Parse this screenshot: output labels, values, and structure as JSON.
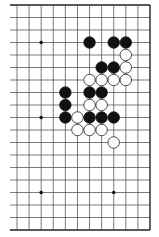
{
  "diagram": {
    "type": "go-board-partial",
    "board_size": 19,
    "visible_columns": [
      7,
      18
    ],
    "visible_rows": [
      0,
      18
    ],
    "edges": {
      "top": true,
      "right": true,
      "bottom": true,
      "left": false
    },
    "colors": {
      "background": "#ffffff",
      "line": "#444444",
      "edge": "#222222",
      "black": "#111111",
      "white": "#ffffff"
    },
    "hoshi": [
      {
        "row": 3,
        "col": 9
      },
      {
        "row": 9,
        "col": 9
      },
      {
        "row": 15,
        "col": 9
      },
      {
        "row": 15,
        "col": 15
      }
    ],
    "stones": [
      {
        "row": 3,
        "col": 13,
        "color": "black"
      },
      {
        "row": 3,
        "col": 15,
        "color": "black"
      },
      {
        "row": 3,
        "col": 16,
        "color": "black"
      },
      {
        "row": 4,
        "col": 16,
        "color": "white"
      },
      {
        "row": 5,
        "col": 14,
        "color": "black"
      },
      {
        "row": 5,
        "col": 15,
        "color": "black"
      },
      {
        "row": 5,
        "col": 16,
        "color": "white"
      },
      {
        "row": 6,
        "col": 13,
        "color": "white"
      },
      {
        "row": 6,
        "col": 14,
        "color": "white"
      },
      {
        "row": 6,
        "col": 15,
        "color": "white"
      },
      {
        "row": 6,
        "col": 16,
        "color": "white"
      },
      {
        "row": 7,
        "col": 11,
        "color": "black"
      },
      {
        "row": 7,
        "col": 13,
        "color": "black"
      },
      {
        "row": 7,
        "col": 14,
        "color": "black"
      },
      {
        "row": 8,
        "col": 11,
        "color": "black"
      },
      {
        "row": 8,
        "col": 13,
        "color": "white"
      },
      {
        "row": 8,
        "col": 14,
        "color": "white"
      },
      {
        "row": 9,
        "col": 11,
        "color": "black"
      },
      {
        "row": 9,
        "col": 12,
        "color": "white"
      },
      {
        "row": 9,
        "col": 13,
        "color": "black"
      },
      {
        "row": 9,
        "col": 14,
        "color": "black"
      },
      {
        "row": 9,
        "col": 15,
        "color": "black"
      },
      {
        "row": 10,
        "col": 12,
        "color": "white"
      },
      {
        "row": 10,
        "col": 13,
        "color": "white"
      },
      {
        "row": 10,
        "col": 14,
        "color": "white"
      },
      {
        "row": 11,
        "col": 15,
        "color": "white"
      }
    ]
  }
}
